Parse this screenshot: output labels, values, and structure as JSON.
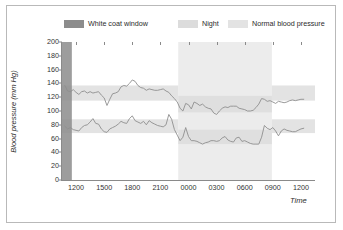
{
  "figure": {
    "background": "#ffffff",
    "border_color": "#b9b9b9"
  },
  "legend": {
    "position": "top",
    "items": [
      {
        "label": "White coat window",
        "color": "#8c8c8c"
      },
      {
        "label": "Night",
        "color": "#dcdcdc"
      },
      {
        "label": "Normal blood pressure",
        "color": "#e3e3e3"
      }
    ]
  },
  "axes": {
    "ylabel": "Blood pressure (mm Hg)",
    "xlabel": "Time",
    "yticks": [
      0,
      20,
      40,
      60,
      80,
      100,
      120,
      140,
      160,
      180,
      200
    ],
    "ytick_labels": [
      "0",
      "20",
      "40",
      "60",
      "80",
      "100",
      "120",
      "140",
      "160",
      "180",
      "200"
    ],
    "ylim": [
      0,
      200
    ],
    "xtick_labels": [
      "1200",
      "1500",
      "1800",
      "2100",
      "0000",
      "0300",
      "0600",
      "0900",
      "1200"
    ],
    "xticks": [
      1200,
      1500,
      1800,
      2100,
      2400,
      2700,
      3000,
      3300,
      3600
    ],
    "xlim": [
      1050,
      3750
    ],
    "grid": false,
    "axis_color": "#8a8a8a"
  },
  "chart_data": {
    "type": "line",
    "title": "",
    "subtitle": "",
    "xlabel": "Time",
    "ylabel": "Blood pressure (mm Hg)",
    "ylim": [
      0,
      200
    ],
    "xlim": [
      1050,
      3750
    ],
    "grid": false,
    "legend_position": "top",
    "x_minutes": [
      1080,
      1110,
      1140,
      1170,
      1200,
      1230,
      1260,
      1290,
      1320,
      1350,
      1380,
      1410,
      1440,
      1470,
      1500,
      1530,
      1560,
      1590,
      1620,
      1650,
      1680,
      1710,
      1740,
      1770,
      1800,
      1830,
      1860,
      1890,
      1920,
      1950,
      1980,
      2010,
      2040,
      2070,
      2100,
      2130,
      2160,
      2190,
      2220,
      2250,
      2280,
      2310,
      2340,
      2370,
      2400,
      2430,
      2460,
      2490,
      2520,
      2550,
      2580,
      2610,
      2640,
      2670,
      2700,
      2730,
      2760,
      2790,
      2820,
      2850,
      2880,
      2910,
      2940,
      2970,
      3000,
      3030,
      3060,
      3090,
      3120,
      3150,
      3180,
      3210,
      3240,
      3270,
      3300,
      3330,
      3360,
      3390,
      3420,
      3450,
      3480,
      3510,
      3540,
      3570,
      3600,
      3630
    ],
    "x_labels_at": [
      "1200",
      "1500",
      "1800",
      "2100",
      "0000",
      "0300",
      "0600",
      "0900",
      "1200"
    ],
    "series": [
      {
        "name": "Systolic",
        "color": "#8f8f8f",
        "values": [
          137,
          129,
          128,
          131,
          127,
          124,
          128,
          129,
          126,
          128,
          126,
          127,
          128,
          123,
          119,
          108,
          117,
          125,
          126,
          128,
          135,
          137,
          136,
          140,
          145,
          143,
          137,
          134,
          133,
          130,
          132,
          131,
          130,
          130,
          131,
          132,
          129,
          127,
          122,
          118,
          113,
          104,
          100,
          111,
          109,
          103,
          113,
          111,
          108,
          110,
          106,
          104,
          103,
          97,
          95,
          100,
          104,
          106,
          105,
          107,
          107,
          107,
          104,
          103,
          102,
          100,
          100,
          101,
          105,
          110,
          118,
          117,
          114,
          115,
          113,
          111,
          114,
          113,
          112,
          113,
          115,
          116,
          115,
          116,
          117,
          117
        ]
      },
      {
        "name": "Diastolic",
        "color": "#8f8f8f",
        "values": [
          78,
          74,
          76,
          73,
          72,
          71,
          76,
          79,
          80,
          84,
          89,
          82,
          81,
          74,
          70,
          69,
          74,
          76,
          78,
          81,
          85,
          83,
          82,
          89,
          93,
          86,
          84,
          82,
          85,
          80,
          86,
          83,
          81,
          79,
          78,
          77,
          80,
          95,
          88,
          73,
          65,
          57,
          62,
          76,
          63,
          57,
          57,
          56,
          54,
          52,
          54,
          55,
          57,
          57,
          56,
          57,
          61,
          63,
          58,
          56,
          55,
          61,
          62,
          56,
          57,
          55,
          53,
          52,
          52,
          52,
          62,
          79,
          75,
          73,
          76,
          71,
          64,
          71,
          74,
          72,
          71,
          70,
          70,
          72,
          74,
          75
        ]
      }
    ],
    "bands": {
      "white_coat_window": {
        "label": "White coat window",
        "color": "#8c8c8c",
        "x_start": 1050,
        "x_end": 1155,
        "orientation": "vertical"
      },
      "night": {
        "label": "Night",
        "color": "#dcdcdc",
        "x_start": 2290,
        "x_end": 3290,
        "orientation": "vertical"
      },
      "normal_blood_pressure": {
        "label": "Normal blood pressure",
        "color": "#e3e3e3",
        "orientation": "horizontal",
        "day_systolic_range": [
          115,
          137
        ],
        "day_diastolic_range": [
          68,
          88
        ],
        "night_systolic_range": [
          98,
          122
        ],
        "night_diastolic_range": [
          52,
          73
        ]
      }
    }
  }
}
